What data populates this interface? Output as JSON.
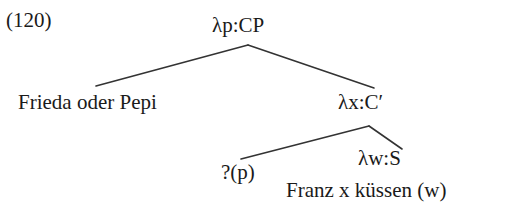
{
  "figure": {
    "example_number": "(120)",
    "background_color": "#ffffff",
    "line_color": "#333333",
    "text_color": "#1a1a1a"
  },
  "tree": {
    "root": {
      "label": "λp:CP",
      "children": {
        "left": {
          "label": "Frieda oder Pepi"
        },
        "right": {
          "label": "λx:C′",
          "children": {
            "left": {
              "label": "?(p)"
            },
            "right": {
              "label": "λw:S",
              "body": "Franz x küssen (w)"
            }
          }
        }
      }
    }
  }
}
